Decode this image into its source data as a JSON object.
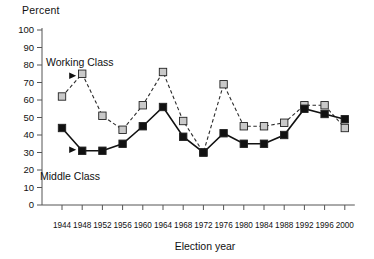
{
  "chart_data": {
    "type": "line",
    "title": "",
    "ylabel": "Percent",
    "xlabel": "Election year",
    "ylim": [
      0,
      100
    ],
    "ytick_step": 10,
    "yticks": [
      100,
      90,
      80,
      70,
      60,
      50,
      40,
      30,
      20,
      10,
      0
    ],
    "grid": false,
    "legend_position": "inline-annotation",
    "categories": [
      1944,
      1948,
      1952,
      1956,
      1960,
      1964,
      1968,
      1972,
      1976,
      1980,
      1984,
      1988,
      1992,
      1996,
      2000
    ],
    "series": [
      {
        "name": "Working Class",
        "marker": "square",
        "color": "#c9c9c9",
        "line_style": "dashed",
        "values": [
          62,
          75,
          51,
          43,
          57,
          76,
          48,
          30,
          69,
          45,
          45,
          47,
          57,
          57,
          44
        ]
      },
      {
        "name": "Middle Class",
        "marker": "square",
        "color": "#111111",
        "line_style": "solid",
        "values": [
          44,
          31,
          31,
          35,
          45,
          56,
          39,
          30,
          41,
          35,
          35,
          40,
          55,
          52,
          49
        ]
      }
    ],
    "annotations": [
      {
        "text": "Working Class",
        "points_to_series": "Working Class",
        "points_to_index": 1
      },
      {
        "text": "Middle Class",
        "points_to_series": "Middle Class",
        "points_to_index": 1
      }
    ]
  },
  "axis": {
    "y_title": "Percent",
    "x_title": "Election year"
  },
  "colors": {
    "working_class": "#c9c9c9",
    "middle_class": "#111111",
    "axis": "#555555",
    "text": "#111111"
  }
}
